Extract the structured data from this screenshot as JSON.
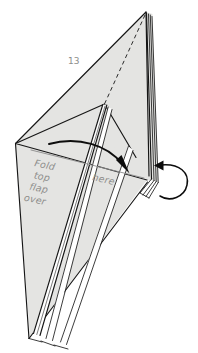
{
  "figure": {
    "kind": "origami-instruction-diagram",
    "step_number": "13",
    "background_color": "#ffffff",
    "paper_fill_color": "#e4e4e2",
    "line_color": "#161616",
    "text_color": "#8d8d8b",
    "guide_color": "#8b8b8b"
  },
  "annotations": {
    "instruction_lines": [
      "Fold",
      "top",
      "flap",
      "over"
    ],
    "instruction_line_1": "Fold",
    "instruction_line_2": "top",
    "instruction_line_3": "flap",
    "instruction_line_4": "over",
    "target_label": "here"
  },
  "icons": {
    "fold_arrow": "curved-fold-arrow-icon",
    "turn_over_loop": "loop-turnover-arrow-icon",
    "valley_fold": "dashed-fold-line-icon"
  }
}
